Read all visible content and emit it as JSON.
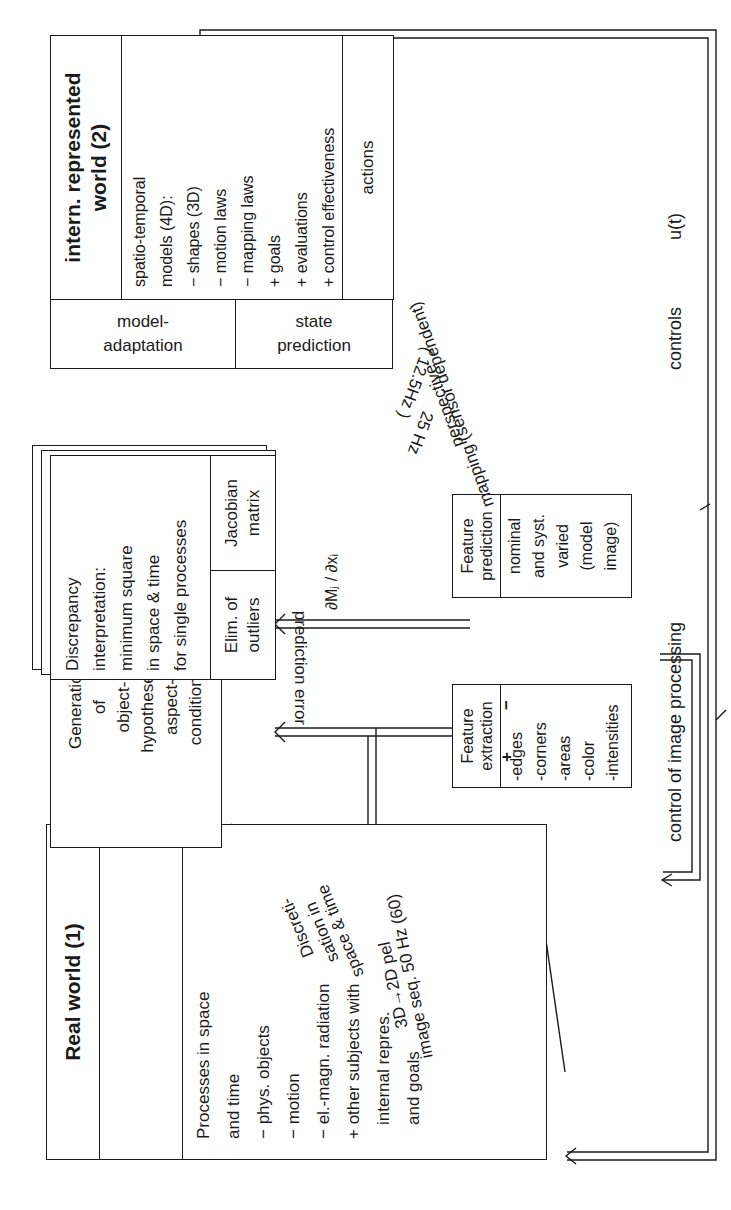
{
  "real_world": {
    "title": "Real world (1)",
    "lines": [
      "Processes in space",
      "and time",
      "− phys. objects",
      "− motion",
      "− el.-magn. radiation",
      "+ other subjects with",
      "   internal repres.",
      "   and goals"
    ]
  },
  "generation": {
    "text": "Generation\nof\nobject-\nhypotheses,\naspect-\nconditions"
  },
  "discrepancy": {
    "main": "Discrepancy\ninterpretation:\nminimum square\nin space & time\nfor single processes",
    "elim": "Elim. of\noutliers",
    "jacobian": "Jacobian\nmatrix"
  },
  "internal_world": {
    "title_line1": "intern. represented",
    "title_line2": "world (2)",
    "lines": [
      "spatio-temporal",
      "models (4D):",
      "− shapes (3D)",
      "− motion laws",
      "− mapping laws",
      "+ goals",
      "+ evaluations",
      "+ control effectiveness"
    ],
    "model_adaptation": "model-\nadaptation",
    "state_prediction": "state\nprediction",
    "actions": "actions"
  },
  "feature_extraction": {
    "title": "Feature\nextraction",
    "items": "-edges\n-corners\n-areas\n-color\n-intensities"
  },
  "feature_prediction": {
    "title": "Feature\nprediction",
    "items": "nominal\nand syst.\nvaried\n(model\nimage)"
  },
  "labels": {
    "discretisation_1": "Discreti-",
    "discretisation_2": "sation in",
    "discretisation_3": "space & time",
    "pel_1": "3D→2D pel",
    "pel_2": "image seq. 50 Hz (60)",
    "rate_1": "25 Hz",
    "rate_2": "( 12.5Hz )",
    "perspective_1": "perspective",
    "perspective_2": "mapping (sensor dependent)",
    "jacobian_partial": "∂Mⱼ / ∂xᵢ",
    "prediction_error": "prediction error",
    "minus_sign": "−",
    "plus_sign": "+",
    "control_image_processing": "control of image processing",
    "controls": "controls",
    "u_t": "u(t)"
  },
  "colors": {
    "ink": "#1a1a1a",
    "paper": "#ffffff"
  }
}
